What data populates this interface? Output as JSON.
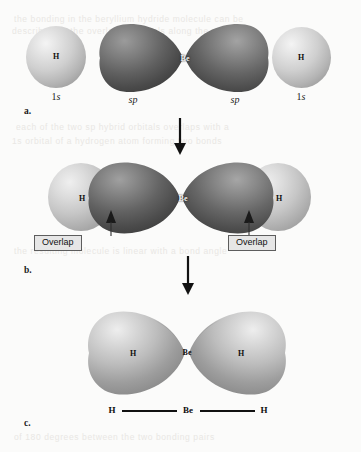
{
  "figure": {
    "background_color": "#fbfbfa"
  },
  "bleed_text": {
    "line1": "the bonding in the beryllium hydride molecule can be",
    "line2": "described by the overlap of orbitals along the axis",
    "line3": "each of the two sp hybrid orbitals overlaps with a",
    "line4": "1s orbital of a hydrogen atom forming two bonds",
    "line5": "the resulting molecule is linear with a bond angle",
    "line6": "of 180 degrees between the two bonding pairs"
  },
  "panels": [
    {
      "letter": "a.",
      "name": "separate-orbitals",
      "items": [
        {
          "kind": "sphere",
          "atom": "H",
          "orbital_label": "1s"
        },
        {
          "kind": "lobe",
          "atom": "Be",
          "orbital_label": "sp"
        },
        {
          "kind": "lobe",
          "atom": "",
          "orbital_label": "sp"
        },
        {
          "kind": "sphere",
          "atom": "H",
          "orbital_label": "1s"
        }
      ],
      "center_atom": "Be"
    },
    {
      "letter": "b.",
      "name": "overlapping-orbitals",
      "atoms": {
        "left": "H",
        "center": "Be",
        "right": "H"
      },
      "callouts": [
        {
          "label": "Overlap",
          "side": "left"
        },
        {
          "label": "Overlap",
          "side": "right"
        }
      ]
    },
    {
      "letter": "c.",
      "name": "merged-bonds",
      "atoms": {
        "left": "H",
        "center": "Be",
        "right": "H"
      },
      "formula": {
        "left": "H",
        "center": "Be",
        "right": "H"
      }
    }
  ],
  "arrows": [
    {
      "name": "arrow-a-to-b",
      "direction": "down"
    },
    {
      "name": "arrow-b-to-c",
      "direction": "down"
    }
  ]
}
